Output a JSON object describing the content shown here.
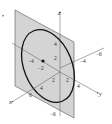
{
  "figure": {
    "bullet": "•",
    "axes": {
      "z": {
        "label": "z",
        "ticks": [
          "4",
          "2",
          "−6"
        ]
      },
      "x": {
        "label": "x",
        "ticks": [
          "2",
          "4",
          "6"
        ]
      },
      "y": {
        "label": "y",
        "ticks": [
          "2",
          "4"
        ]
      },
      "neg_y": {
        "ticks": [
          "−4",
          "−6"
        ]
      },
      "neg_x": {
        "ticks": [
          "−4",
          "−2"
        ]
      }
    },
    "colors": {
      "plane": "#d4d4d4",
      "plane_edge": "#555555",
      "ellipse": "#111111",
      "axis": "#555555"
    }
  }
}
